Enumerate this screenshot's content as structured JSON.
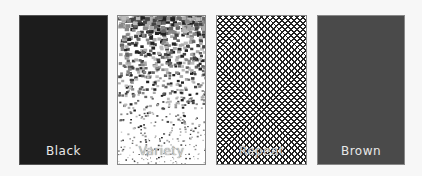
{
  "swatches": [
    {
      "id": "black",
      "label": "Black",
      "fill": "#1c1c1c",
      "kind": "solid"
    },
    {
      "id": "variety",
      "label": "Variety",
      "fill": "#ffffff",
      "kind": "speckle-gradient"
    },
    {
      "id": "repeat",
      "label": "Repeat",
      "fill": "#ffffff",
      "kind": "crosshatch"
    },
    {
      "id": "brown",
      "label": "Brown",
      "fill": "#4a4a4a",
      "kind": "solid"
    }
  ],
  "colors": {
    "background": "#f7f7f7",
    "label_text": "#e8e8e8"
  }
}
